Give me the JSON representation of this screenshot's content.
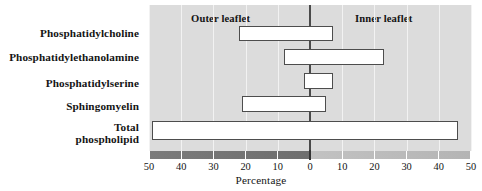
{
  "figure": {
    "axis_title": "Percentage",
    "outer_label": "Outer leaflet",
    "inner_label": "Inner leaflet"
  },
  "chart_data": {
    "type": "bar",
    "orientation": "horizontal",
    "title": "",
    "subtitle": "",
    "xlabel": "Percentage",
    "ylabel": "",
    "xlim": [
      -50,
      50
    ],
    "x_tick_values": [
      -50,
      -40,
      -30,
      -20,
      -10,
      0,
      10,
      20,
      30,
      40,
      50
    ],
    "x_tick_labels": [
      "50",
      "40",
      "30",
      "20",
      "10",
      "0",
      "10",
      "20",
      "30",
      "40",
      "50"
    ],
    "grid": true,
    "grid_axis": "x",
    "legend": null,
    "annotations": [
      {
        "text": "Outer leaflet",
        "side": "left",
        "value": -25
      },
      {
        "text": "Inner leaflet",
        "side": "right",
        "value": 25
      }
    ],
    "note": "Negative x = outer leaflet percentage, positive x = inner leaflet percentage",
    "categories": [
      "Phosphatidylcholine",
      "Phosphatidylethanolamine",
      "Phosphatidylserine",
      "Sphingomyelin",
      "Total\nphospholipid"
    ],
    "series": [
      {
        "name": "Outer leaflet",
        "values": [
          22,
          8,
          2,
          21,
          49
        ]
      },
      {
        "name": "Inner leaflet",
        "values": [
          7,
          23,
          7,
          5,
          46
        ]
      }
    ],
    "bars": [
      {
        "category": "Phosphatidylcholine",
        "outer": 22,
        "inner": 7,
        "row": 0
      },
      {
        "category": "Phosphatidylethanolamine",
        "outer": 8,
        "inner": 23,
        "row": 1
      },
      {
        "category": "Phosphatidylserine",
        "outer": 2,
        "inner": 7,
        "row": 2
      },
      {
        "category": "Sphingomyelin",
        "outer": 21,
        "inner": 5,
        "row": 3
      },
      {
        "category": "Total phospholipid",
        "outer": 49,
        "inner": 46,
        "row": 4
      }
    ],
    "colors": {
      "plot_background": "#dcdcdc",
      "gridline": "#f2f2f2",
      "bar_fill": "#ffffff",
      "bar_stroke": "#4d4d4d",
      "zero_axis": "#4a4a4a",
      "strip_outer": "#6e6e6e",
      "strip_inner": "#bbbbbb",
      "text": "#141414"
    }
  },
  "labels": {
    "rows": [
      {
        "line1": "Phosphatidylcholine",
        "line2": ""
      },
      {
        "line1": "Phosphatidylethanolamine",
        "line2": ""
      },
      {
        "line1": "Phosphatidylserine",
        "line2": ""
      },
      {
        "line1": "Sphingomyelin",
        "line2": ""
      },
      {
        "line1": "Total",
        "line2": "phospholipid"
      }
    ]
  },
  "ticks": [
    {
      "label": "50",
      "value": -50
    },
    {
      "label": "40",
      "value": -40
    },
    {
      "label": "30",
      "value": -30
    },
    {
      "label": "20",
      "value": -20
    },
    {
      "label": "10",
      "value": -10
    },
    {
      "label": "0",
      "value": 0
    },
    {
      "label": "10",
      "value": 10
    },
    {
      "label": "20",
      "value": 20
    },
    {
      "label": "30",
      "value": 30
    },
    {
      "label": "40",
      "value": 40
    },
    {
      "label": "50",
      "value": 50
    }
  ]
}
